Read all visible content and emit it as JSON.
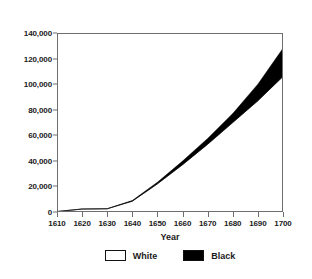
{
  "chart_data": {
    "type": "area",
    "title": "",
    "xlabel": "Year",
    "ylabel": "",
    "xlim": [
      1610,
      1700
    ],
    "ylim": [
      0,
      140000
    ],
    "grid": false,
    "stacked": true,
    "legend_position": "bottom",
    "x": [
      1610,
      1620,
      1630,
      1640,
      1650,
      1660,
      1670,
      1680,
      1690,
      1700
    ],
    "x_tick_labels": [
      "1610",
      "1620",
      "1630",
      "1640",
      "1650",
      "1660",
      "1670",
      "1680",
      "1690",
      "1700"
    ],
    "y_tick_values": [
      0,
      20000,
      40000,
      60000,
      80000,
      100000,
      120000,
      140000
    ],
    "y_tick_labels": [
      "0",
      "20,000",
      "40,000",
      "60,000",
      "80,000",
      "100,000",
      "120,000",
      "140,000"
    ],
    "series": [
      {
        "name": "White",
        "color": "#ffffff",
        "values": [
          350,
          2300,
          2500,
          8500,
          22000,
          37000,
          53000,
          70000,
          87000,
          106000
        ]
      },
      {
        "name": "Black",
        "color": "#000000",
        "values": [
          20,
          60,
          120,
          500,
          1300,
          2800,
          4500,
          7000,
          13000,
          22000
        ]
      }
    ],
    "totals": [
      370,
      2360,
      2620,
      9000,
      23300,
      39800,
      57500,
      77000,
      100000,
      128000
    ]
  },
  "legend": {
    "items": [
      {
        "label": "White",
        "swatch": "white-swatch"
      },
      {
        "label": "Black",
        "swatch": "black-swatch"
      }
    ]
  },
  "axis": {
    "x_title": "Year"
  },
  "colors": {
    "axis_line": "#6e6e6e",
    "series_black": "#000000",
    "series_white": "#ffffff",
    "text": "#1a1a1a"
  }
}
